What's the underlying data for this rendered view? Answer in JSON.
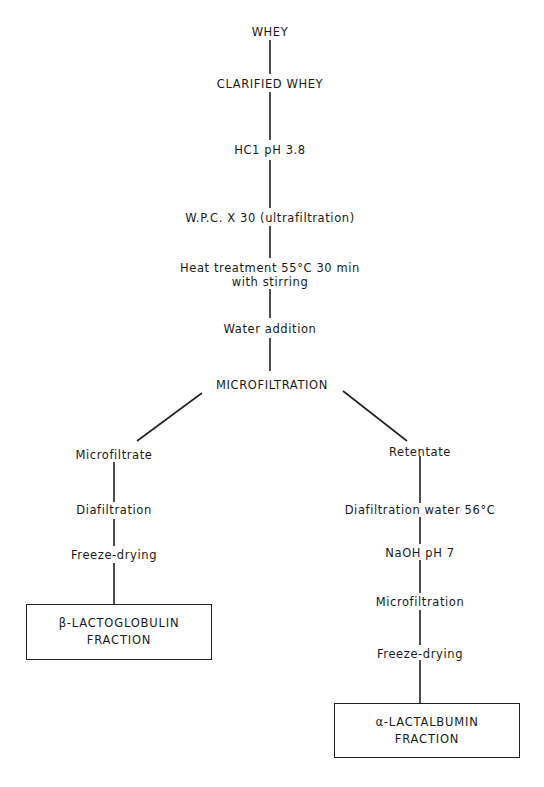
{
  "diagram": {
    "type": "process-flowchart",
    "main_trunk": [
      {
        "id": "whey",
        "label": "WHEY"
      },
      {
        "id": "clarified",
        "label": "CLARIFIED WHEY"
      },
      {
        "id": "hcl",
        "label": "HC1 pH 3.8"
      },
      {
        "id": "wpc",
        "label": "W.P.C. X 30 (ultrafiltration)"
      },
      {
        "id": "heat",
        "label_line1": "Heat treatment 55°C   30 min",
        "label_line2": "with stirring"
      },
      {
        "id": "water",
        "label": "Water addition"
      },
      {
        "id": "microfiltration",
        "label": "MICROFILTRATION"
      }
    ],
    "left_branch": {
      "steps": [
        {
          "id": "microfiltrate",
          "label": "Microfiltrate"
        },
        {
          "id": "diafiltration",
          "label": "Diafiltration"
        },
        {
          "id": "freeze_left",
          "label": "Freeze-drying"
        }
      ],
      "result": {
        "line1": "β-LACTOGLOBULIN",
        "line2": "FRACTION"
      }
    },
    "right_branch": {
      "steps": [
        {
          "id": "retentate",
          "label": "Retentate"
        },
        {
          "id": "diafiltration_water",
          "label": "Diafiltration water 56°C"
        },
        {
          "id": "naoh",
          "label": "NaOH pH 7"
        },
        {
          "id": "microfiltration2",
          "label": "Microfiltration"
        },
        {
          "id": "freeze_right",
          "label": "Freeze-drying"
        }
      ],
      "result": {
        "line1": "α-LACTALBUMIN",
        "line2": "FRACTION"
      }
    },
    "edges": [
      [
        "whey",
        "clarified"
      ],
      [
        "clarified",
        "hcl"
      ],
      [
        "hcl",
        "wpc"
      ],
      [
        "wpc",
        "heat"
      ],
      [
        "heat",
        "water"
      ],
      [
        "water",
        "microfiltration"
      ],
      [
        "microfiltration",
        "microfiltrate"
      ],
      [
        "microfiltrate",
        "diafiltration"
      ],
      [
        "diafiltration",
        "freeze_left"
      ],
      [
        "freeze_left",
        "beta_lactoglobulin_fraction"
      ],
      [
        "microfiltration",
        "retentate"
      ],
      [
        "retentate",
        "diafiltration_water"
      ],
      [
        "diafiltration_water",
        "naoh"
      ],
      [
        "naoh",
        "microfiltration2"
      ],
      [
        "microfiltration2",
        "freeze_right"
      ],
      [
        "freeze_right",
        "alpha_lactalbumin_fraction"
      ]
    ]
  }
}
